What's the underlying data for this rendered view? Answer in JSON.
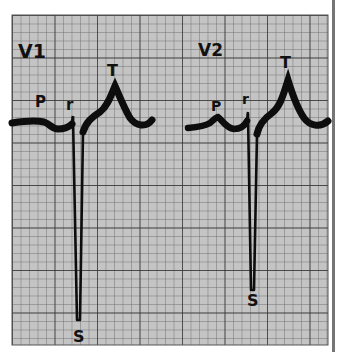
{
  "figure": {
    "colors": {
      "paper": "#c4c4c4",
      "grid_minor": "#6a6a6a",
      "grid_major": "#2e2e2e",
      "trace": "#0d0d0d",
      "background": "#ffffff",
      "edge_strip": "#3a3a3a"
    },
    "grid": {
      "minor_px": 8.5,
      "major_every": 5
    }
  },
  "leads": [
    {
      "name": "V1",
      "waves": {
        "p": "P",
        "r": "r",
        "s": "S",
        "t": "T"
      }
    },
    {
      "name": "V2",
      "waves": {
        "p": "P",
        "r": "r",
        "s": "S",
        "t": "T"
      }
    }
  ]
}
